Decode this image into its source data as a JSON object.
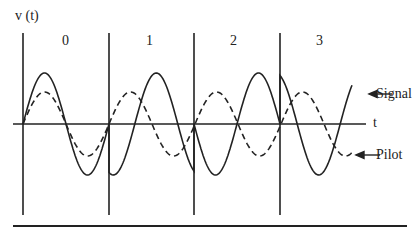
{
  "diagram": {
    "y_axis_label": "v (t)",
    "x_axis_label": "t",
    "intervals": [
      {
        "label": "0",
        "signal_phase_deg": 0
      },
      {
        "label": "1",
        "signal_phase_deg": -108
      },
      {
        "label": "2",
        "signal_phase_deg": 180
      },
      {
        "label": "3",
        "signal_phase_deg": 108
      }
    ],
    "legend": [
      {
        "label": "Signal",
        "style": "solid"
      },
      {
        "label": "Pilot",
        "style": "dashed"
      }
    ],
    "colors": {
      "line": "#222222",
      "background": "#ffffff"
    }
  }
}
